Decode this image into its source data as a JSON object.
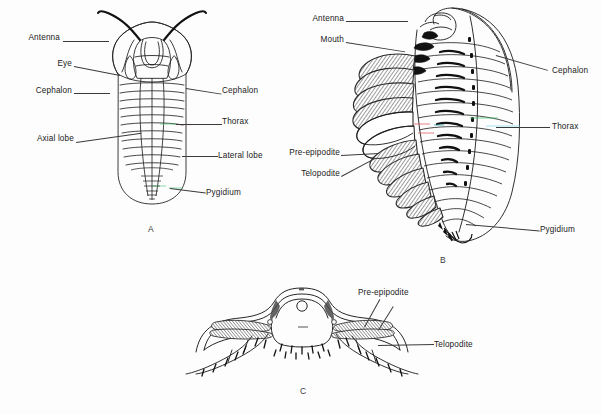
{
  "figure": {
    "background_color": "#fdfdfd",
    "ink_color": "#1a1a1a",
    "label_color": "#222222",
    "panels": [
      {
        "id": "A",
        "caption": "A",
        "view": "dorsal view of complete trilobite",
        "labels_left": [
          {
            "text": "Antenna",
            "x": 14,
            "y": 38,
            "lx": 62,
            "ly": 41,
            "tx": 107,
            "ty": 33
          },
          {
            "text": "Eye",
            "x": 56,
            "y": 64,
            "lx": 76,
            "ly": 67,
            "tx": 120,
            "ty": 75
          },
          {
            "text": "Cephalon",
            "x": 31,
            "y": 91,
            "lx": 78,
            "ly": 94,
            "tx": 108,
            "ty": 94
          },
          {
            "text": "Axial lobe",
            "x": 28,
            "y": 139,
            "lx": 79,
            "ly": 142,
            "tx": 140,
            "ty": 132
          }
        ],
        "labels_right": [
          {
            "text": "Cephalon",
            "x": 222,
            "y": 91,
            "lx": 196,
            "ly": 94,
            "tx": 186,
            "ty": 90
          },
          {
            "text": "Thorax",
            "x": 222,
            "y": 122,
            "lx": 196,
            "ly": 125,
            "tx": 168,
            "ty": 124
          },
          {
            "text": "Lateral lobe",
            "x": 218,
            "y": 156,
            "lx": 196,
            "ly": 159,
            "tx": 180,
            "ty": 155
          },
          {
            "text": "Pygidium",
            "x": 208,
            "y": 192,
            "lx": 196,
            "ly": 195,
            "tx": 172,
            "ty": 189
          }
        ]
      },
      {
        "id": "B",
        "caption": "B",
        "view": "oblique ventro-lateral view showing appendages",
        "labels_left": [
          {
            "text": "Antenna",
            "x": 306,
            "y": 18,
            "lx": 348,
            "ly": 21,
            "tx": 406,
            "ty": 21
          },
          {
            "text": "Mouth",
            "x": 316,
            "y": 39,
            "lx": 348,
            "ly": 42,
            "tx": 404,
            "ty": 52
          },
          {
            "text": "Pre-epipodite",
            "x": 281,
            "y": 152,
            "lx": 341,
            "ly": 155,
            "tx": 378,
            "ty": 152
          },
          {
            "text": "Telopodite",
            "x": 291,
            "y": 173,
            "lx": 341,
            "ly": 176,
            "tx": 372,
            "ty": 156
          }
        ],
        "labels_right": [
          {
            "text": "Cephalon",
            "x": 552,
            "y": 70,
            "lx": 548,
            "ly": 73,
            "tx": 498,
            "ty": 57
          },
          {
            "text": "Thorax",
            "x": 552,
            "y": 126,
            "lx": 548,
            "ly": 129,
            "tx": 468,
            "ty": 126
          },
          {
            "text": "Pygidium",
            "x": 540,
            "y": 229,
            "lx": 536,
            "ly": 232,
            "tx": 458,
            "ty": 222
          }
        ]
      },
      {
        "id": "C",
        "caption": "C",
        "view": "transverse section through thoracic segment",
        "labels_right": [
          {
            "text": "Pre-epipodite",
            "x": 358,
            "y": 292,
            "lx": 392,
            "ly": 300,
            "tx": 362,
            "ty": 326
          },
          {
            "text": "Telopodite",
            "x": 434,
            "y": 344,
            "lx": 430,
            "ly": 347,
            "tx": 378,
            "ty": 344
          }
        ]
      }
    ]
  },
  "terms": {
    "antenna": "Antenna",
    "eye": "Eye",
    "cephalon": "Cephalon",
    "axial_lobe": "Axial lobe",
    "lateral_lobe": "Lateral lobe",
    "thorax": "Thorax",
    "pygidium": "Pygidium",
    "mouth": "Mouth",
    "pre_epipodite": "Pre-epipodite",
    "telopodite": "Telopodite"
  }
}
